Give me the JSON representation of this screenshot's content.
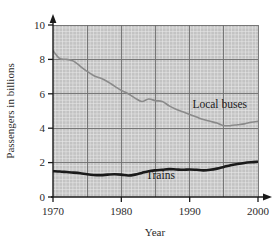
{
  "chart_data": {
    "type": "line",
    "title": "",
    "xlabel": "Year",
    "ylabel": "Passengers in billions",
    "xlim": [
      1970,
      2000
    ],
    "ylim": [
      0,
      10
    ],
    "xticks": [
      1970,
      1980,
      1990,
      2000
    ],
    "yticks": [
      0,
      2,
      4,
      6,
      8,
      10
    ],
    "xtick_labels": [
      "1970",
      "1980",
      "1990",
      "2000"
    ],
    "ytick_labels": [
      "0",
      "2",
      "4",
      "6",
      "8",
      "10"
    ],
    "grid": true,
    "grid_minor_step_x": 1,
    "grid_minor_step_y": 0.2,
    "grid_major_step_x": 5,
    "grid_major_step_y": 2,
    "legend_position": "inline-annotation",
    "series": [
      {
        "name": "Local buses",
        "color": "#8a8a8a",
        "label_x": 1990.4,
        "label_y": 5.15,
        "x": [
          1970,
          1971,
          1972,
          1973,
          1974,
          1975,
          1976,
          1977,
          1978,
          1979,
          1980,
          1981,
          1982,
          1983,
          1984,
          1985,
          1986,
          1987,
          1988,
          1989,
          1990,
          1991,
          1992,
          1993,
          1994,
          1995,
          1996,
          1997,
          1998,
          1999,
          2000
        ],
        "values": [
          8.5,
          8.05,
          8.0,
          7.9,
          7.6,
          7.3,
          7.05,
          6.9,
          6.7,
          6.45,
          6.2,
          6.0,
          5.75,
          5.55,
          5.7,
          5.6,
          5.55,
          5.3,
          5.1,
          4.95,
          4.8,
          4.65,
          4.5,
          4.4,
          4.3,
          4.15,
          4.15,
          4.2,
          4.25,
          4.35,
          4.4
        ]
      },
      {
        "name": "Trains",
        "color": "#1a1a1a",
        "label_x": 1983.6,
        "label_y": 1.05,
        "x": [
          1970,
          1971,
          1972,
          1973,
          1974,
          1975,
          1976,
          1977,
          1978,
          1979,
          1980,
          1981,
          1982,
          1983,
          1984,
          1985,
          1986,
          1987,
          1988,
          1989,
          1990,
          1991,
          1992,
          1993,
          1994,
          1995,
          1996,
          1997,
          1998,
          1999,
          2000
        ],
        "values": [
          1.5,
          1.48,
          1.45,
          1.42,
          1.38,
          1.32,
          1.28,
          1.27,
          1.3,
          1.32,
          1.3,
          1.25,
          1.3,
          1.4,
          1.5,
          1.55,
          1.58,
          1.62,
          1.6,
          1.58,
          1.6,
          1.58,
          1.55,
          1.58,
          1.65,
          1.75,
          1.85,
          1.92,
          1.98,
          2.02,
          2.05
        ]
      }
    ]
  },
  "axes": {
    "x_arrow": "arrow-right",
    "y_arrow": "arrow-up"
  }
}
